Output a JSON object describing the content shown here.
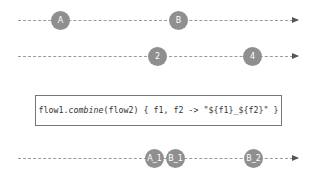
{
  "flows": [
    {
      "name": "flow1",
      "y": 20,
      "marbles": [
        {
          "label": "A",
          "x": 60
        },
        {
          "label": "B",
          "x": 178
        }
      ]
    },
    {
      "name": "flow2",
      "y": 56,
      "marbles": [
        {
          "label": "2",
          "x": 157
        },
        {
          "label": "4",
          "x": 252
        }
      ]
    },
    {
      "name": "result",
      "y": 158,
      "marbles": [
        {
          "label": "A_1",
          "x": 154
        },
        {
          "label": "B_1",
          "x": 175
        },
        {
          "label": "B_2",
          "x": 253
        }
      ]
    }
  ],
  "operator": {
    "receiver": "flow1.",
    "method": "combine",
    "rest": "(flow2) { f1, f2 -> \"${f1}_${f2}\" }"
  },
  "colors": {
    "marble": "#8f8f8f",
    "line": "#9a9a9a",
    "border": "#777777"
  }
}
